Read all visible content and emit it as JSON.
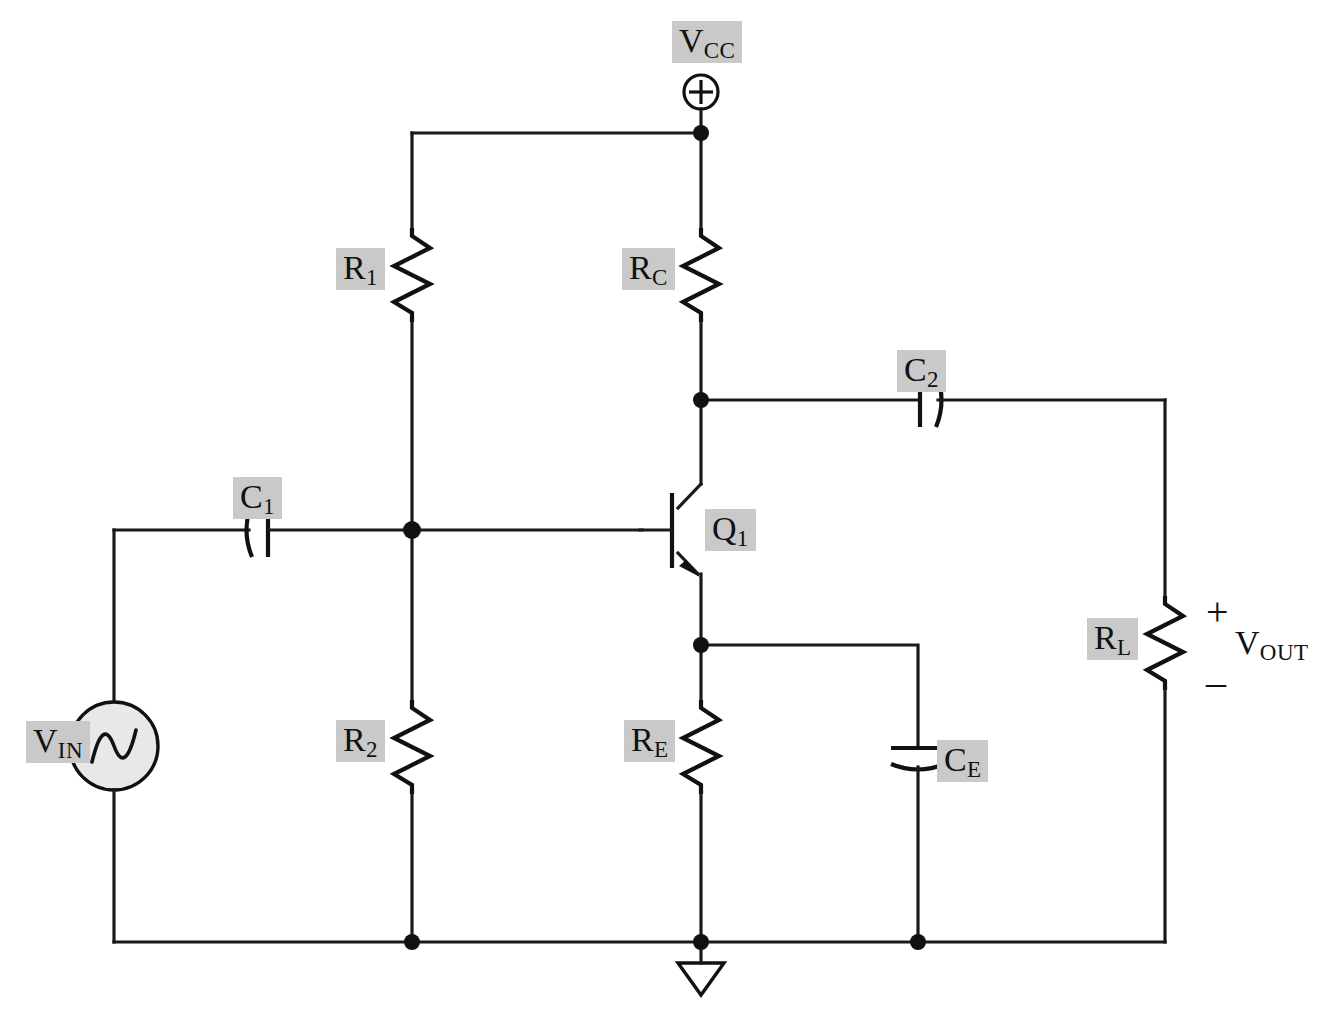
{
  "diagram": {
    "type": "circuit-schematic",
    "background_color": "#ffffff",
    "wire_color": "#1a1a1a",
    "label_highlight_color": "#c9c9c9"
  },
  "labels": {
    "vcc": {
      "base": "V",
      "sub": "CC",
      "highlight": true
    },
    "r1": {
      "base": "R",
      "sub": "1",
      "highlight": true
    },
    "rc": {
      "base": "R",
      "sub": "C",
      "highlight": true
    },
    "c2": {
      "base": "C",
      "sub": "2",
      "highlight": true
    },
    "c1": {
      "base": "C",
      "sub": "1",
      "highlight": true
    },
    "q1": {
      "base": "Q",
      "sub": "1",
      "highlight": true
    },
    "r2": {
      "base": "R",
      "sub": "2",
      "highlight": true
    },
    "re": {
      "base": "R",
      "sub": "E",
      "highlight": true
    },
    "ce": {
      "base": "C",
      "sub": "E",
      "highlight": true
    },
    "rl": {
      "base": "R",
      "sub": "L",
      "highlight": true
    },
    "vin": {
      "base": "V",
      "sub": "IN",
      "highlight": true
    },
    "vout": {
      "base": "V",
      "sub": "OUT",
      "highlight": false
    },
    "polarity_plus": "+",
    "polarity_minus": "–"
  },
  "components": [
    {
      "id": "vcc-terminal",
      "kind": "supply-terminal",
      "symbol": "circled-plus",
      "label": "V_CC"
    },
    {
      "id": "r1",
      "kind": "resistor",
      "orientation": "vertical",
      "label": "R_1"
    },
    {
      "id": "r2",
      "kind": "resistor",
      "orientation": "vertical",
      "label": "R_2"
    },
    {
      "id": "rc",
      "kind": "resistor",
      "orientation": "vertical",
      "label": "R_C"
    },
    {
      "id": "re",
      "kind": "resistor",
      "orientation": "vertical",
      "label": "R_E"
    },
    {
      "id": "rl",
      "kind": "resistor",
      "orientation": "vertical",
      "label": "R_L"
    },
    {
      "id": "c1",
      "kind": "capacitor",
      "orientation": "horizontal",
      "style": "curved-plate",
      "label": "C_1"
    },
    {
      "id": "c2",
      "kind": "capacitor",
      "orientation": "horizontal",
      "style": "curved-plate",
      "label": "C_2"
    },
    {
      "id": "ce",
      "kind": "capacitor",
      "orientation": "vertical",
      "style": "curved-plate",
      "label": "C_E"
    },
    {
      "id": "q1",
      "kind": "transistor",
      "device": "npn-bjt",
      "label": "Q_1"
    },
    {
      "id": "vin",
      "kind": "ac-voltage-source",
      "symbol": "sine-in-circle",
      "label": "V_IN"
    },
    {
      "id": "ground",
      "kind": "ground",
      "symbol": "open-triangle"
    },
    {
      "id": "vout",
      "kind": "output-port",
      "label": "V_OUT",
      "polarity": "+ top, – bottom"
    }
  ],
  "nodes": [
    {
      "id": "vcc-rail",
      "label": "V_CC rail"
    },
    {
      "id": "base-node",
      "label": "base bias node"
    },
    {
      "id": "collector-node",
      "label": "collector node"
    },
    {
      "id": "emitter-node",
      "label": "emitter node"
    },
    {
      "id": "ground-rail",
      "label": "ground rail"
    }
  ]
}
